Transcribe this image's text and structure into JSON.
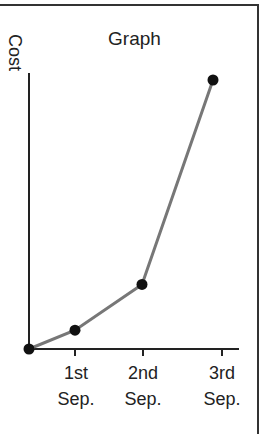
{
  "chart_data": {
    "type": "line",
    "title": "Graph",
    "xlabel": "",
    "ylabel": "Cost",
    "categories": [
      "",
      "1st Sep.",
      "2nd Sep.",
      "3rd Sep."
    ],
    "x_tick_labels": [
      {
        "line1": "1st",
        "line2": "Sep."
      },
      {
        "line1": "2nd",
        "line2": "Sep."
      },
      {
        "line1": "3rd",
        "line2": "Sep."
      }
    ],
    "series": [
      {
        "name": "Cost",
        "values": [
          0,
          7,
          24,
          100
        ]
      }
    ],
    "ylim": [
      0,
      100
    ],
    "grid": false,
    "legend": null
  },
  "colors": {
    "line": "#777777",
    "marker": "#111111",
    "axis": "#222222"
  }
}
